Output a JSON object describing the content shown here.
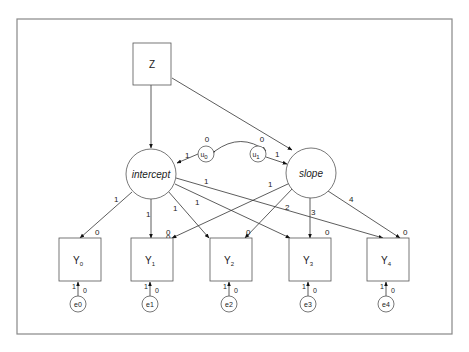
{
  "diagram": {
    "type": "path-diagram",
    "frame": {
      "color": "#888888"
    },
    "nodes": {
      "Z": {
        "label": "Z"
      },
      "intercept": {
        "label": "intercept"
      },
      "slope": {
        "label": "slope"
      },
      "u0": {
        "label": "u",
        "sub": "0",
        "mean": "0"
      },
      "u1": {
        "label": "u",
        "sub": "1",
        "mean": "0"
      },
      "Y0": {
        "label": "Y",
        "sub": "0",
        "intercept": "0"
      },
      "Y1": {
        "label": "Y",
        "sub": "1",
        "intercept": "0"
      },
      "Y2": {
        "label": "Y",
        "sub": "2",
        "intercept": "0"
      },
      "Y3": {
        "label": "Y",
        "sub": "3",
        "intercept": "0"
      },
      "Y4": {
        "label": "Y",
        "sub": "4",
        "intercept": "0"
      },
      "e0": {
        "label": "e0",
        "mean": "0",
        "weight": "1"
      },
      "e1": {
        "label": "e1",
        "mean": "0",
        "weight": "1"
      },
      "e2": {
        "label": "e2",
        "mean": "0",
        "weight": "1"
      },
      "e3": {
        "label": "e3",
        "mean": "0",
        "weight": "1"
      },
      "e4": {
        "label": "e4",
        "mean": "0",
        "weight": "1"
      }
    },
    "edges": {
      "u0_intercept": "1",
      "u1_slope": "1",
      "intercept_Y0": "1",
      "intercept_Y1": "1",
      "intercept_Y2": "1",
      "intercept_Y3": "1",
      "intercept_Y4": "1",
      "slope_Y0": "0",
      "slope_Y1": "1",
      "slope_Y2": "2",
      "slope_Y3": "3",
      "slope_Y4": "4"
    }
  }
}
